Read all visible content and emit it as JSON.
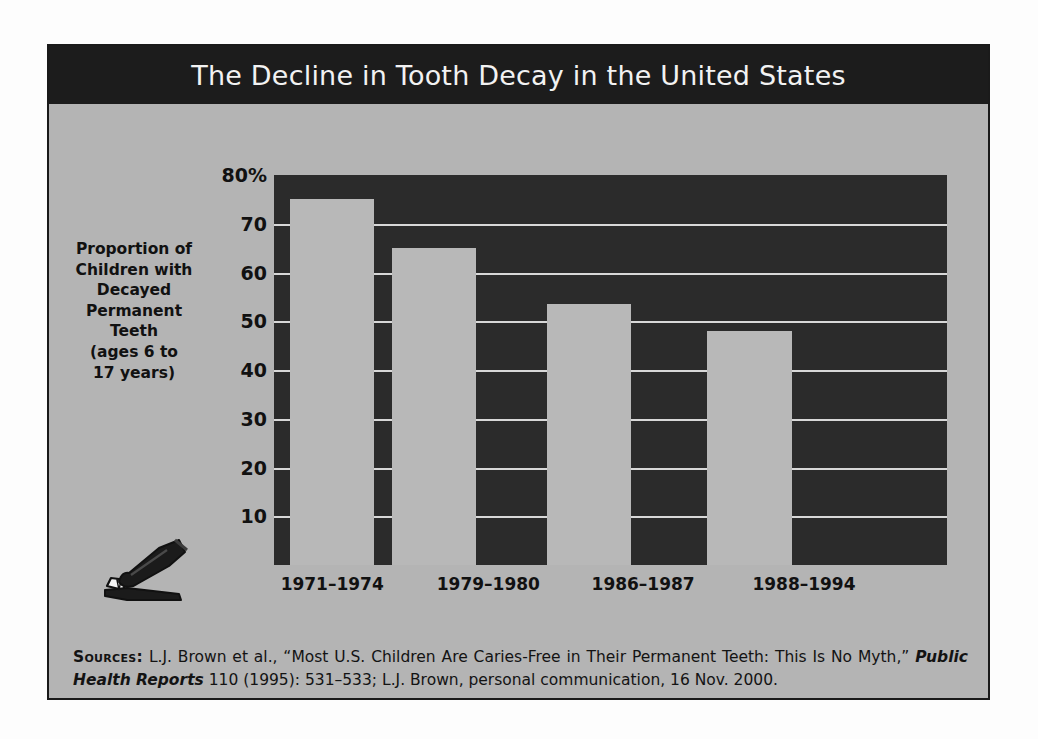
{
  "figure": {
    "title": "The Decline in Tooth Decay in the United States",
    "axis_title_lines": [
      "Proportion of",
      "Children with",
      "Decayed",
      "Permanent",
      "Teeth",
      "(ages 6 to",
      "17 years)"
    ],
    "icon": "toothpaste-tube-and-toothbrush-icon",
    "sources_label": "Sources:",
    "sources_part1": " L.J. Brown et al., “Most U.S. Children Are Caries-Free in Their Permanent Teeth: This Is No Myth,” ",
    "sources_italic": "Public Health Reports",
    "sources_part2": " 110 (1995): 531–533; L.J. Brown, personal communication, 16 Nov. 2000.",
    "colors": {
      "title_band": "#1c1c1c",
      "title_text": "#f2f2f2",
      "panel_background": "#b4b4b4",
      "plot_background": "#2b2b2b",
      "bar_fill": "#b8b8b8",
      "gridline": "#d8d8d8",
      "text": "#111111"
    }
  },
  "chart_data": {
    "type": "bar",
    "title": "The Decline in Tooth Decay in the United States",
    "xlabel": "",
    "ylabel": "Proportion of Children with Decayed Permanent Teeth (ages 6 to 17 years)",
    "categories": [
      "1971–1974",
      "1979–1980",
      "1986–1987",
      "1988–1994"
    ],
    "values": [
      75,
      65,
      53.5,
      48
    ],
    "ylim": [
      0,
      80
    ],
    "yticks": [
      10,
      20,
      30,
      40,
      50,
      60,
      70,
      80
    ],
    "ytick_labels": [
      "10",
      "20",
      "30",
      "40",
      "50",
      "60",
      "70",
      "80%"
    ],
    "units": "percent",
    "grid": true,
    "legend": "none"
  }
}
